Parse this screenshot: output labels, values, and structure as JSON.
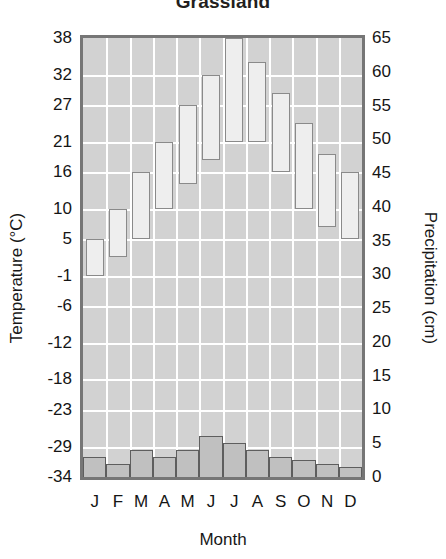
{
  "chart_data": {
    "type": "bar",
    "title": "Grassland",
    "xlabel": "Month",
    "ylabel": "Temperature (°C)",
    "y2label": "Precipitation (cm)",
    "grid": true,
    "legend": "none",
    "categories": [
      "J",
      "F",
      "M",
      "A",
      "M",
      "J",
      "J",
      "A",
      "S",
      "O",
      "N",
      "D"
    ],
    "ylim": [
      -34,
      38
    ],
    "yticks": [
      38,
      32,
      27,
      21,
      16,
      10,
      5,
      -1,
      -6,
      -12,
      -18,
      -23,
      -29,
      -34
    ],
    "y2lim": [
      0,
      65
    ],
    "y2ticks": [
      65,
      60,
      55,
      50,
      45,
      40,
      35,
      30,
      25,
      20,
      15,
      10,
      5,
      0
    ],
    "series": [
      {
        "name": "Temperature range",
        "type": "range-bar",
        "unit": "°C",
        "low": [
          -1,
          2,
          5,
          10,
          14,
          18,
          21,
          21,
          16,
          10,
          7,
          5
        ],
        "high": [
          5,
          10,
          16,
          21,
          27,
          32,
          38,
          34,
          29,
          24,
          19,
          16
        ]
      },
      {
        "name": "Precipitation",
        "type": "bar",
        "unit": "cm",
        "values": [
          3,
          2,
          4,
          3,
          4,
          6,
          5,
          4,
          3,
          2.5,
          2,
          1.5
        ]
      }
    ]
  },
  "labels": {
    "title": "Grassland",
    "x_axis": "Month",
    "y_left_axis": "Temperature (°C)",
    "y_right_axis": "Precipitation (cm)"
  }
}
